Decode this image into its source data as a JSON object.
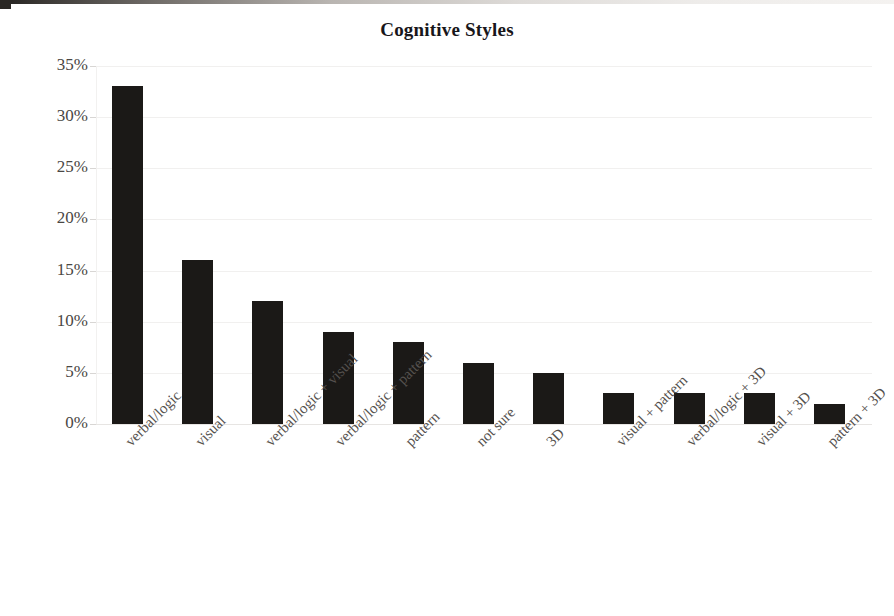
{
  "chart_data": {
    "type": "bar",
    "title": "Cognitive Styles",
    "xlabel": "",
    "ylabel": "",
    "categories": [
      "verbal/logic",
      "visual",
      "verbal/logic + visual",
      "verbal/logic + pattern",
      "pattern",
      "not sure",
      "3D",
      "visual + pattern",
      "verbal/logic + 3D",
      "visual + 3D",
      "pattern + 3D"
    ],
    "values": [
      33,
      16,
      12,
      9,
      8,
      6,
      5,
      3,
      3,
      3,
      2
    ],
    "value_unit": "%",
    "ylim": [
      0,
      35
    ],
    "ytick_values": [
      0,
      5,
      10,
      15,
      20,
      25,
      30,
      35
    ],
    "ytick_labels": [
      "0%",
      "5%",
      "10%",
      "15%",
      "20%",
      "25%",
      "30%",
      "35%"
    ],
    "grid": true,
    "legend": false,
    "bar_color": "#1b1917",
    "grid_color": "#f1f0ef",
    "text_color": "#4a4744",
    "background": "#ffffff"
  }
}
